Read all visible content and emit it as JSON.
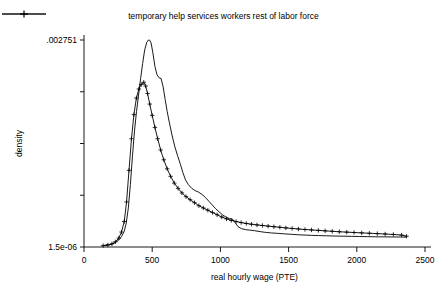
{
  "chart_data": {
    "type": "line",
    "title": "",
    "xlabel": "real hourly wage (PTE)",
    "ylabel": "density",
    "xlim": [
      0,
      2500
    ],
    "ylim": [
      1.5e-06,
      0.002751
    ],
    "grid": false,
    "legend_position": "top-center",
    "xticks": [
      "0",
      "500",
      "1000",
      "1500",
      "2000",
      "2500"
    ],
    "xtick_values": [
      0,
      500,
      1000,
      1500,
      2000,
      2500
    ],
    "yticks": [
      ".002751",
      "1.5e-06"
    ],
    "ytick_values": [
      0.002751,
      1.5e-06
    ],
    "y_minor_tick_count": 5,
    "series": [
      {
        "name": "temporary help services workers",
        "marker": "none",
        "x": [
          140,
          175,
          205,
          230,
          255,
          275,
          295,
          310,
          325,
          340,
          355,
          370,
          385,
          400,
          415,
          430,
          445,
          460,
          472,
          482,
          492,
          505,
          520,
          535,
          550,
          565,
          580,
          595,
          610,
          625,
          645,
          665,
          685,
          705,
          725,
          745,
          765,
          790,
          815,
          840,
          865,
          890,
          915,
          940,
          965,
          990,
          1015,
          1040,
          1065,
          1090,
          1110,
          1130,
          1155,
          1185,
          1215,
          1250,
          1290,
          1330,
          1375,
          1420,
          1470,
          1520,
          1570,
          1620,
          1670,
          1720,
          1780,
          1840,
          1900,
          1960,
          2020,
          2080,
          2140,
          2200,
          2260,
          2320,
          2365
        ],
        "y": [
          2e-05,
          2.8e-05,
          4e-05,
          6.2e-05,
          9.5e-05,
          0.00014,
          0.00021,
          0.00032,
          0.00052,
          0.00083,
          0.0012,
          0.00154,
          0.0018,
          0.00202,
          0.00224,
          0.00244,
          0.00262,
          0.00272,
          0.002751,
          0.002748,
          0.00271,
          0.00258,
          0.0024,
          0.00229,
          0.00225,
          0.00224,
          0.00213,
          0.00196,
          0.0018,
          0.00166,
          0.00149,
          0.00134,
          0.00122,
          0.00111,
          0.00099,
          0.00089,
          0.00083,
          0.00078,
          0.00075,
          0.00073,
          0.0007,
          0.00066,
          0.00061,
          0.00056,
          0.00051,
          0.00047,
          0.00043,
          0.0004,
          0.00038,
          0.00037,
          0.00032,
          0.00027,
          0.000245,
          0.000232,
          0.000226,
          0.000218,
          0.000206,
          0.000196,
          0.000188,
          0.000183,
          0.000176,
          0.00017,
          0.000164,
          0.00016,
          0.000156,
          0.000153,
          0.00015,
          0.000147,
          0.000145,
          0.000143,
          0.000141,
          0.000139,
          0.000137,
          0.000136,
          0.000135,
          0.000134,
          0.000132
        ]
      },
      {
        "name": "rest of labor force",
        "marker": "plus",
        "x": [
          140,
          175,
          205,
          230,
          255,
          275,
          295,
          312,
          330,
          348,
          366,
          384,
          402,
          420,
          438,
          452,
          466,
          482,
          500,
          520,
          540,
          562,
          585,
          610,
          635,
          662,
          690,
          718,
          748,
          778,
          810,
          842,
          875,
          908,
          942,
          976,
          1010,
          1045,
          1080,
          1115,
          1152,
          1190,
          1228,
          1268,
          1308,
          1350,
          1392,
          1436,
          1480,
          1526,
          1572,
          1620,
          1668,
          1718,
          1768,
          1820,
          1872,
          1926,
          1980,
          2036,
          2092,
          2150,
          2208,
          2268,
          2328,
          2365
        ],
        "y": [
          2e-05,
          2.9e-05,
          4.3e-05,
          7e-05,
          0.00012,
          0.0002,
          0.00034,
          0.0006,
          0.00102,
          0.00144,
          0.00176,
          0.00198,
          0.0021,
          0.00216,
          0.00219,
          0.00214,
          0.00204,
          0.0019,
          0.00175,
          0.00159,
          0.00144,
          0.00129,
          0.00116,
          0.00104,
          0.00094,
          0.00085,
          0.00078,
          0.00072,
          0.00067,
          0.00063,
          0.00059,
          0.00055,
          0.00052,
          0.00049,
          0.00046,
          0.00043,
          0.0004,
          0.000375,
          0.000355,
          0.00034,
          0.000326,
          0.000314,
          0.000304,
          0.000295,
          0.000287,
          0.000279,
          0.000271,
          0.000263,
          0.000255,
          0.000248,
          0.000241,
          0.000234,
          0.000228,
          0.000222,
          0.000216,
          0.00021,
          0.000204,
          0.000199,
          0.000194,
          0.000189,
          0.000184,
          0.000179,
          0.000174,
          0.000168,
          0.00016,
          0.000145
        ]
      }
    ]
  },
  "legend": {
    "entries": [
      {
        "label": "temporary help services workers",
        "marker": "none"
      },
      {
        "label": "rest of labor force",
        "marker": "plus"
      }
    ]
  }
}
